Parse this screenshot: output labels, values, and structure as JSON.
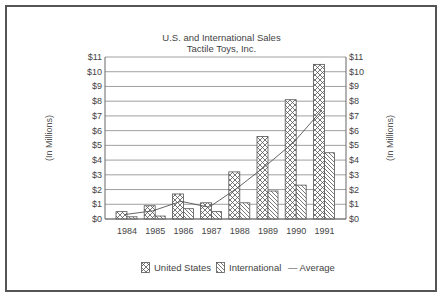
{
  "chart_data": {
    "type": "bar",
    "title": "U.S. and International Sales",
    "subtitle": "Tactile Toys, Inc.",
    "xlabel": "",
    "ylabel": "(In Millions)",
    "ylabel_right": "(In Millions)",
    "ylim": [
      0,
      11
    ],
    "yticks": [
      "$0",
      "$1",
      "$2",
      "$3",
      "$4",
      "$5",
      "$6",
      "$7",
      "$8",
      "$9",
      "$10",
      "$11"
    ],
    "categories": [
      "1984",
      "1985",
      "1986",
      "1987",
      "1988",
      "1989",
      "1990",
      "1991"
    ],
    "series": [
      {
        "name": "United States",
        "type": "bar",
        "pattern": "crosshatch",
        "values": [
          0.5,
          0.9,
          1.7,
          1.1,
          3.2,
          5.6,
          8.1,
          10.5
        ]
      },
      {
        "name": "International",
        "type": "bar",
        "pattern": "diagonal",
        "values": [
          0.15,
          0.2,
          0.7,
          0.5,
          1.1,
          1.9,
          2.3,
          4.5
        ]
      },
      {
        "name": "Average",
        "type": "line",
        "values": [
          0.3,
          0.55,
          1.2,
          0.8,
          2.1,
          3.6,
          5.2,
          7.4
        ]
      }
    ],
    "grid": true,
    "legend_position": "bottom"
  },
  "legend": {
    "us": "United States",
    "intl": "International",
    "avg": "— Average"
  },
  "colors": {
    "ink": "#444444",
    "grid": "#888888",
    "background": "#ffffff"
  }
}
